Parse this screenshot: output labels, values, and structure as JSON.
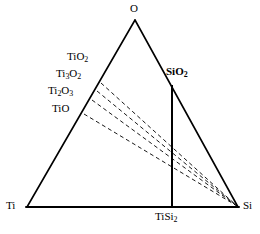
{
  "figure": {
    "kind": "ternary-phase-diagram",
    "system": "Ti-Si-O",
    "background_color": "#ffffff",
    "line_color": "#000000"
  },
  "vertices": {
    "top": {
      "label": "O",
      "element": "oxygen",
      "x": 135,
      "y": 20
    },
    "bottom_left": {
      "label": "Ti",
      "element": "titanium",
      "x": 27,
      "y": 207
    },
    "bottom_right": {
      "label": "Si",
      "element": "silicon",
      "x": 238,
      "y": 207
    }
  },
  "edge_phases": [
    {
      "name": "TiO2",
      "label_html": "TiO<sub>2</sub>",
      "edge": "Ti-O",
      "x": 98,
      "y": 80
    },
    {
      "name": "Ti3O2",
      "label_html": "Ti<sub>3</sub>O<sub>2</sub>",
      "edge": "Ti-O",
      "x": 93,
      "y": 92
    },
    {
      "name": "Ti2O3",
      "label_html": "Ti<sub>2</sub>O<sub>3</sub>",
      "edge": "Ti-O",
      "x": 88,
      "y": 103
    },
    {
      "name": "TiO",
      "label_html": "TiO",
      "edge": "Ti-O",
      "x": 82,
      "y": 114
    }
  ],
  "interior_phases": [
    {
      "name": "SiO2",
      "label_html": "SiO<sub>2</sub>",
      "edge": "O-Si",
      "x": 172,
      "y": 85,
      "bold": true
    },
    {
      "name": "TiSi2",
      "label_html": "TiSi<sub>2</sub>",
      "edge": "Ti-Si",
      "x": 172,
      "y": 207,
      "bold": false
    }
  ],
  "labels": {
    "oxygen": "O",
    "titanium": "Ti",
    "silicon": "Si",
    "tio2": "TiO",
    "tio2_sub": "2",
    "ti3o2_a": "Ti",
    "ti3o2_sub1": "3",
    "ti3o2_b": "O",
    "ti3o2_sub2": "2",
    "ti2o3_a": "Ti",
    "ti2o3_sub1": "2",
    "ti2o3_b": "O",
    "ti2o3_sub2": "3",
    "tio": "TiO",
    "sio2": "SiO",
    "sio2_sub": "2",
    "tisi2": "TiSi",
    "tisi2_sub": "2"
  },
  "solid_lines": [
    {
      "name": "edge-Ti-O",
      "x1": 27,
      "y1": 207,
      "x2": 135,
      "y2": 20
    },
    {
      "name": "edge-O-Si",
      "x1": 135,
      "y1": 20,
      "x2": 238,
      "y2": 207
    },
    {
      "name": "edge-Ti-Si",
      "x1": 27,
      "y1": 207,
      "x2": 238,
      "y2": 207
    },
    {
      "name": "tieline-SiO2-TiSi2",
      "x1": 172,
      "y1": 85,
      "x2": 172,
      "y2": 207
    }
  ],
  "dashed_lines": [
    {
      "name": "tieline-TiO2-Si",
      "from": "TiO2",
      "x1": 101,
      "y1": 83,
      "x2": 238,
      "y2": 207
    },
    {
      "name": "tieline-Ti3O2-Si",
      "from": "Ti3O2",
      "x1": 97,
      "y1": 91,
      "x2": 238,
      "y2": 207
    },
    {
      "name": "tieline-Ti2O3-Si",
      "from": "Ti2O3",
      "x1": 92,
      "y1": 100,
      "x2": 238,
      "y2": 207
    },
    {
      "name": "tieline-TiO-Si",
      "from": "TiO",
      "x1": 84,
      "y1": 114,
      "x2": 238,
      "y2": 207
    }
  ],
  "style": {
    "edge_stroke_width": 1.6,
    "baseline_stroke_width": 2.0,
    "tieline_stroke_width": 2.0,
    "dash_stroke_width": 0.9,
    "dash_pattern": "4,3"
  }
}
